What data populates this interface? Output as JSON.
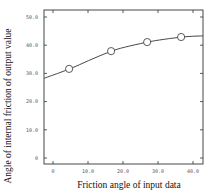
{
  "chart_data": {
    "type": "line",
    "title": "",
    "xlabel": "Friction angle of input data",
    "ylabel": "Angle of internal friction of output value",
    "xlim": [
      -2.5,
      43
    ],
    "ylim": [
      -2,
      55
    ],
    "grid": false,
    "legend": null,
    "x_ticks": [
      0,
      10,
      20,
      30,
      40
    ],
    "x_tick_labels": [
      "0",
      "10.0",
      "20.0",
      "30.0",
      "40.0"
    ],
    "y_ticks": [
      0,
      10,
      20,
      30,
      40,
      50
    ],
    "y_tick_labels": [
      "0",
      "10.0",
      "20.0",
      "30.0",
      "40.0",
      "50.0"
    ],
    "series": [
      {
        "name": "fitted curve",
        "style": "solid line",
        "x": [
          -2.5,
          5,
          10,
          16.6,
          20,
          26.9,
          30,
          36.6,
          40,
          43
        ],
        "y": [
          28.3,
          31.6,
          34.5,
          37.9,
          39.2,
          41.1,
          41.8,
          42.9,
          43.2,
          43.3
        ]
      },
      {
        "name": "data points",
        "style": "open circle markers",
        "x": [
          4.6,
          16.6,
          26.9,
          36.6
        ],
        "y": [
          31.6,
          37.9,
          41.1,
          42.9
        ]
      }
    ]
  }
}
